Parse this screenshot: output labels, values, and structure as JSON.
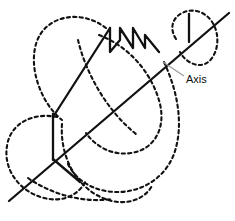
{
  "figure": {
    "background_color": "#ffffff",
    "stroke_color": "#111111",
    "leader_color": "#9a9a9a",
    "width": 235,
    "height": 221
  },
  "annotations": {
    "axis_label": "Axis",
    "axis_label_x": 186,
    "axis_label_y": 79
  },
  "geometry": {
    "axis_line": {
      "name": "central-axis",
      "style": "solid",
      "x1": 9,
      "y1": 201,
      "x2": 229,
      "y2": 13
    },
    "leader_line": {
      "name": "axis-leader",
      "x1": 163,
      "y1": 62,
      "x2": 184,
      "y2": 76
    },
    "dashed_curves": [
      {
        "name": "upper-left-loop",
        "path": "M 106 28 C 80 8 44 16 36 44 C 28 72 44 106 62 120"
      },
      {
        "name": "upper-mid-loop",
        "path": "M 78 40 C 86 74 108 112 136 134"
      },
      {
        "name": "upper-right-loop",
        "path": "M 176 39 C 164 20 184 6 200 12 C 218 19 222 44 212 58 C 203 71 186 64 180 52"
      },
      {
        "name": "inner-right-sweep",
        "path": "M 99 35 C 128 46 152 72 160 104 C 166 130 153 150 131 153 C 112 156 95 146 86 133"
      },
      {
        "name": "outer-right-sweep",
        "path": "M 164 62 C 178 92 184 126 174 154 C 163 183 133 196 106 191 C 88 188 74 177 68 164"
      },
      {
        "name": "lower-left-loop",
        "path": "M 57 117 C 32 112 10 124 7 146 C 3 170 20 192 44 198 C 64 203 80 194 86 180"
      },
      {
        "name": "lower-mid-loop",
        "path": "M 62 124 C 60 152 72 180 95 194 C 118 208 142 203 152 186"
      },
      {
        "name": "lower-cross-arc",
        "path": "M 28 178 C 54 196 86 203 112 199"
      }
    ],
    "solid_lines": [
      {
        "name": "left-vertical-tick",
        "x1": 53,
        "y1": 114,
        "x2": 53,
        "y2": 160
      },
      {
        "name": "right-vertical-tick",
        "x1": 189,
        "y1": 14,
        "x2": 189,
        "y2": 42
      },
      {
        "name": "long-diagonal-rise",
        "x1": 53,
        "y1": 117,
        "x2": 110,
        "y2": 28
      },
      {
        "name": "lower-left-diagonal",
        "x1": 53,
        "y1": 159,
        "x2": 80,
        "y2": 182
      }
    ],
    "sawtooth": {
      "name": "sawtooth-wave",
      "points": "110,28 110,52 120,40 120,28 133,48 133,28 145,48 145,35 159,52"
    },
    "sawtooth_teeth": [
      {
        "peak_x": 110,
        "peak_y": 28,
        "valley_y": 52
      },
      {
        "peak_x": 120,
        "peak_y": 28,
        "valley_y": 47
      },
      {
        "peak_x": 133,
        "peak_y": 28,
        "valley_y": 48
      },
      {
        "peak_x": 145,
        "peak_y": 35,
        "valley_y": 50
      }
    ]
  }
}
